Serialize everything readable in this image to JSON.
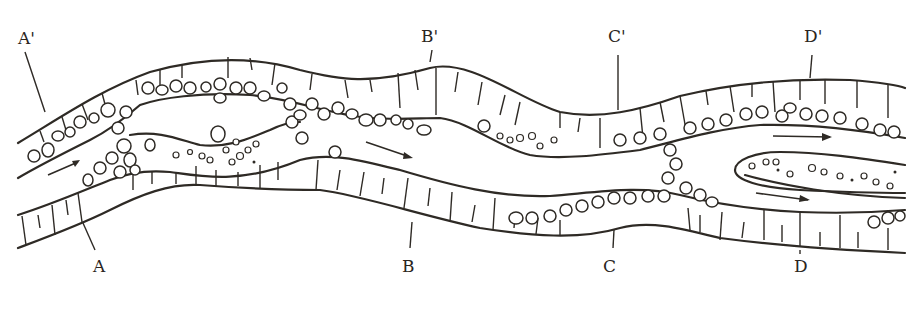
{
  "diagram": {
    "title": "",
    "colors": {
      "ink": "#2e2a25",
      "background": "#ffffff"
    },
    "sections": [
      {
        "id": "A",
        "top_label": "A'",
        "bottom_label": "A"
      },
      {
        "id": "B",
        "top_label": "B'",
        "bottom_label": "B"
      },
      {
        "id": "C",
        "top_label": "C'",
        "bottom_label": "C"
      },
      {
        "id": "D",
        "top_label": "D'",
        "bottom_label": "D"
      }
    ],
    "flow_arrows": 4
  }
}
